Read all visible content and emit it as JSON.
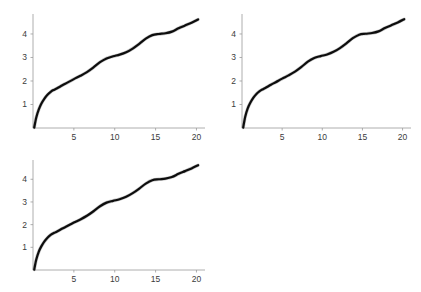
{
  "figure": {
    "title": "",
    "background_color": "#ffffff",
    "panel_count": 3,
    "grid": "2x2 with bottom-right empty"
  },
  "chart_data": [
    {
      "type": "line",
      "title": "",
      "xlabel": "",
      "ylabel": "",
      "xlim": [
        0,
        20.8
      ],
      "ylim": [
        0,
        4.85
      ],
      "xticks": [
        5,
        10,
        15,
        20
      ],
      "xticklabels": [
        "5",
        "10",
        "15",
        "20"
      ],
      "yticks": [
        1,
        2,
        3,
        4
      ],
      "yticklabels": [
        "1",
        "2",
        "3",
        "4"
      ],
      "grid": false,
      "legend": null,
      "line_color": "#0d0d0d",
      "x": [
        0.15,
        0.4,
        0.7,
        1.0,
        1.4,
        1.8,
        2.2,
        2.6,
        3.0,
        3.6,
        4.2,
        5.0,
        5.8,
        6.6,
        7.4,
        8.2,
        9.0,
        9.8,
        10.6,
        11.4,
        12.2,
        13.0,
        13.8,
        14.6,
        15.4,
        16.2,
        17.0,
        17.8,
        18.6,
        19.4,
        20.2
      ],
      "y": [
        0.02,
        0.45,
        0.78,
        1.02,
        1.25,
        1.42,
        1.55,
        1.63,
        1.7,
        1.82,
        1.93,
        2.08,
        2.22,
        2.38,
        2.58,
        2.8,
        2.96,
        3.05,
        3.12,
        3.22,
        3.38,
        3.58,
        3.8,
        3.95,
        4.0,
        4.03,
        4.1,
        4.24,
        4.36,
        4.48,
        4.62
      ]
    },
    {
      "type": "line",
      "title": "",
      "xlabel": "",
      "ylabel": "",
      "xlim": [
        0,
        20.8
      ],
      "ylim": [
        0,
        4.85
      ],
      "xticks": [
        5,
        10,
        15,
        20
      ],
      "xticklabels": [
        "5",
        "10",
        "15",
        "20"
      ],
      "yticks": [
        1,
        2,
        3,
        4
      ],
      "yticklabels": [
        "1",
        "2",
        "3",
        "4"
      ],
      "grid": false,
      "legend": null,
      "line_color": "#0d0d0d",
      "x": [
        0.15,
        0.4,
        0.7,
        1.0,
        1.4,
        1.8,
        2.2,
        2.6,
        3.0,
        3.6,
        4.2,
        5.0,
        5.8,
        6.6,
        7.4,
        8.2,
        9.0,
        9.8,
        10.6,
        11.4,
        12.2,
        13.0,
        13.8,
        14.6,
        15.4,
        16.2,
        17.0,
        17.8,
        18.6,
        19.4,
        20.2
      ],
      "y": [
        0.02,
        0.48,
        0.82,
        1.05,
        1.28,
        1.45,
        1.57,
        1.65,
        1.72,
        1.84,
        1.95,
        2.1,
        2.24,
        2.4,
        2.6,
        2.82,
        2.98,
        3.06,
        3.13,
        3.24,
        3.4,
        3.6,
        3.82,
        3.97,
        4.01,
        4.04,
        4.11,
        4.25,
        4.37,
        4.49,
        4.63
      ]
    },
    {
      "type": "line",
      "title": "",
      "xlabel": "",
      "ylabel": "",
      "xlim": [
        0,
        20.8
      ],
      "ylim": [
        0,
        4.85
      ],
      "xticks": [
        5,
        10,
        15,
        20
      ],
      "xticklabels": [
        "5",
        "10",
        "15",
        "20"
      ],
      "yticks": [
        1,
        2,
        3,
        4
      ],
      "yticklabels": [
        "1",
        "2",
        "3",
        "4"
      ],
      "grid": false,
      "legend": null,
      "line_color": "#0d0d0d",
      "x": [
        0.15,
        0.4,
        0.7,
        1.0,
        1.4,
        1.8,
        2.2,
        2.6,
        3.0,
        3.6,
        4.2,
        5.0,
        5.8,
        6.6,
        7.4,
        8.2,
        9.0,
        9.8,
        10.6,
        11.4,
        12.2,
        13.0,
        13.8,
        14.6,
        15.4,
        16.2,
        17.0,
        17.8,
        18.6,
        19.4,
        20.2
      ],
      "y": [
        0.02,
        0.46,
        0.8,
        1.03,
        1.26,
        1.43,
        1.56,
        1.64,
        1.71,
        1.83,
        1.94,
        2.09,
        2.23,
        2.39,
        2.59,
        2.81,
        2.97,
        3.05,
        3.12,
        3.23,
        3.39,
        3.59,
        3.81,
        3.96,
        4.0,
        4.03,
        4.1,
        4.24,
        4.36,
        4.48,
        4.62
      ]
    }
  ]
}
